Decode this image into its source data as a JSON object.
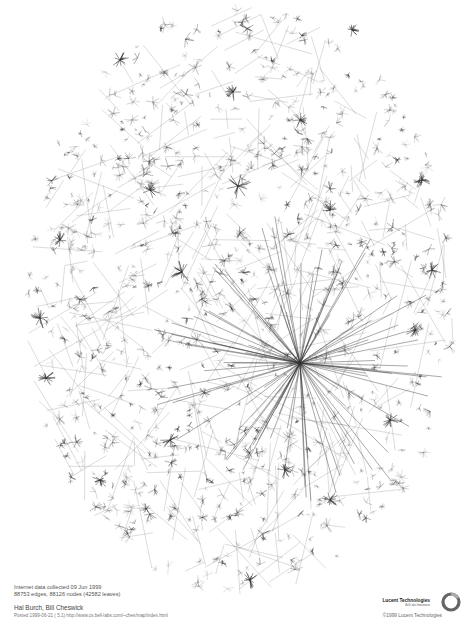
{
  "poster": {
    "subject": "Internet map graph visualization",
    "caption": {
      "line1": "Internet data collected 09 Jun 1999",
      "line2": "88753 edges, 88126 nodes (42582 leaves)",
      "authors": "Hal Burch, Bill Cheswick",
      "posted": "Posted 1999-06-21  ( 5.1)  http://www.cs.bell-labs.com/~ches/map/index.html"
    },
    "brand": {
      "name": "Lucent Technologies",
      "tagline": "Bell Labs Innovations",
      "copyright": "©1999 Lucent Technologies"
    }
  },
  "graph": {
    "shape": "ellipse",
    "center": [
      240,
      300
    ],
    "radius": [
      215,
      295
    ],
    "ink_color": "#333333",
    "major_hub": {
      "x": 300,
      "y": 363,
      "spokes": 90
    },
    "hubs": [
      {
        "x": 238,
        "y": 186,
        "size": 14
      },
      {
        "x": 182,
        "y": 272,
        "size": 12
      },
      {
        "x": 40,
        "y": 318,
        "size": 11
      },
      {
        "x": 46,
        "y": 378,
        "size": 10
      },
      {
        "x": 432,
        "y": 270,
        "size": 10
      },
      {
        "x": 422,
        "y": 180,
        "size": 9
      },
      {
        "x": 233,
        "y": 92,
        "size": 9
      },
      {
        "x": 352,
        "y": 30,
        "size": 8
      },
      {
        "x": 120,
        "y": 60,
        "size": 9
      },
      {
        "x": 415,
        "y": 330,
        "size": 10
      },
      {
        "x": 250,
        "y": 580,
        "size": 9
      },
      {
        "x": 330,
        "y": 500,
        "size": 9
      },
      {
        "x": 170,
        "y": 440,
        "size": 10
      },
      {
        "x": 150,
        "y": 190,
        "size": 10
      },
      {
        "x": 330,
        "y": 210,
        "size": 10
      },
      {
        "x": 100,
        "y": 480,
        "size": 9
      },
      {
        "x": 390,
        "y": 420,
        "size": 9
      },
      {
        "x": 285,
        "y": 470,
        "size": 9
      },
      {
        "x": 60,
        "y": 240,
        "size": 9
      },
      {
        "x": 300,
        "y": 120,
        "size": 9
      }
    ]
  }
}
